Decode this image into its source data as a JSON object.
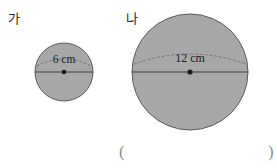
{
  "figure": {
    "type": "geometry-illustration",
    "background_color": "#ffffff",
    "circle_fill_color": "#a8a8a8",
    "circle_stroke_color": "#5a5a5a",
    "line_color": "#4a4a4a",
    "dash_color": "#707070",
    "text_color": "#1a1a1a",
    "shapes": [
      {
        "name": "circle-ga",
        "label": "가",
        "measure_text": "6 cm",
        "measure_type": "diameter",
        "measure_value": 6,
        "measure_unit": "cm",
        "center_x": 64,
        "center_y": 72,
        "radius": 29
      },
      {
        "name": "circle-na",
        "label": "나",
        "measure_text": "12 cm",
        "measure_type": "diameter",
        "measure_value": 12,
        "measure_unit": "cm",
        "center_x": 190,
        "center_y": 72,
        "radius": 58
      }
    ]
  },
  "answer_blank": {
    "open_paren": "(",
    "close_paren": ")"
  }
}
